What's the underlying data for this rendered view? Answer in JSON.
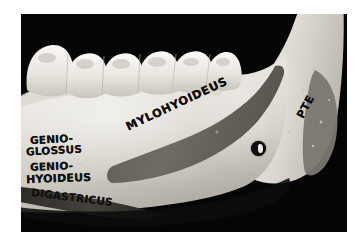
{
  "page": {
    "background_color": "#ffffff",
    "width": 363,
    "height": 241
  },
  "photograph": {
    "kind": "anatomical-specimen-photo",
    "subject": "human mandible, medial (lingual) view of right half",
    "background_color": "#050505",
    "bone_color": "#e6e3dc",
    "marking_color": "#6b6861",
    "ink_color": "#121212",
    "frame": {
      "left": 21,
      "top": 14,
      "width": 326,
      "height": 218
    }
  },
  "labels": {
    "mylohyoideus": "MYLOHYOIDEUS",
    "genioglossus_line1": "GENIO-",
    "genioglossus_line2": "GLOSSUS",
    "geniohyoideus_line1": "GENIO-",
    "geniohyoideus_line2": "HYOIDEUS",
    "digastricus": "DIGASTRICUS",
    "pterygoideus": "PTE"
  },
  "features": {
    "teeth_label": "molar and premolar row",
    "mylohyoid_line_label": "mylohyoid line marking",
    "mandibular_foramen_label": "mandibular foramen",
    "digastric_fossa_label": "digastric fossa marking",
    "ramus_label": "ramus of mandible",
    "pterygoid_patch_label": "medial pterygoid attachment marking"
  }
}
